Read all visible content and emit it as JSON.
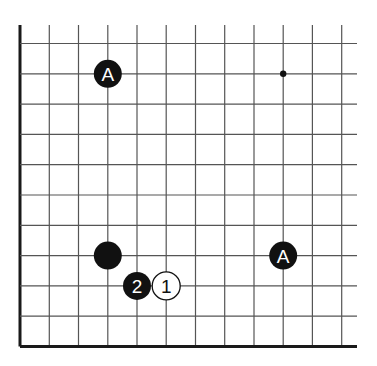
{
  "diagram": {
    "type": "go-board-corner",
    "grid": {
      "columns_x": [
        20,
        49.3,
        78.5,
        107.8,
        137,
        166.2,
        195.5,
        224.7,
        254,
        283.2,
        312.4,
        341.7
      ],
      "rows_y": [
        43.5,
        73.8,
        104.1,
        134.4,
        164.7,
        195,
        225.3,
        255.6,
        285.9,
        316.2,
        346.5
      ],
      "top_y": 25,
      "right_x": 357,
      "edge_left": true,
      "edge_bottom": true,
      "line_color": "#555555",
      "edge_color": "#1a1a1a"
    },
    "star_points": [
      {
        "col": 9,
        "row": 1
      }
    ],
    "stones": [
      {
        "id": "stone-a-top",
        "color": "black",
        "col": 3,
        "row": 1,
        "label": "A"
      },
      {
        "id": "stone-black-plain",
        "color": "black",
        "col": 3,
        "row": 7,
        "label": ""
      },
      {
        "id": "stone-move-2",
        "color": "black",
        "col": 4,
        "row": 8,
        "label": "2"
      },
      {
        "id": "stone-move-1",
        "color": "white",
        "col": 5,
        "row": 8,
        "label": "1"
      },
      {
        "id": "stone-a-right",
        "color": "black",
        "col": 9,
        "row": 7,
        "label": "A"
      }
    ],
    "colors": {
      "black_stone": "#111111",
      "white_stone": "#ffffff",
      "black_label": "#ffffff",
      "white_label": "#111111"
    }
  }
}
